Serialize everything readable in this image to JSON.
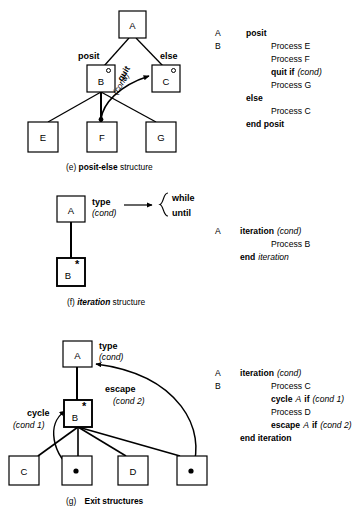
{
  "figure": {
    "panels": [
      {
        "id": "e",
        "caption_prefix": "(e)",
        "caption_bold": "posit-else",
        "caption_suffix": "structure",
        "nodes": [
          {
            "name": "A",
            "label": "A",
            "marker": ""
          },
          {
            "name": "B",
            "label": "B",
            "marker": "circle"
          },
          {
            "name": "C",
            "label": "C",
            "marker": "circle"
          },
          {
            "name": "E",
            "label": "E",
            "marker": ""
          },
          {
            "name": "F",
            "label": "F",
            "marker": ""
          },
          {
            "name": "G",
            "label": "G",
            "marker": ""
          }
        ],
        "edge_labels": [
          {
            "name": "posit-label",
            "text": "posit"
          },
          {
            "name": "else-label",
            "text": "else"
          },
          {
            "name": "quit-label",
            "text": "quit"
          },
          {
            "name": "quit-cond-label",
            "text": "(cond)"
          }
        ],
        "code": [
          {
            "col1": "A",
            "col2": "posit",
            "col2_bold": true,
            "col3": "",
            "indent": 0
          },
          {
            "col1": "B",
            "col2": "",
            "col3": "Process E",
            "indent": 1
          },
          {
            "col1": "",
            "col2": "",
            "col3": "Process F",
            "indent": 1
          },
          {
            "col1": "",
            "col2": "",
            "col3": "quit if (cond)",
            "indent": 1
          },
          {
            "col1": "",
            "col2": "",
            "col3": "Process G",
            "indent": 1
          },
          {
            "col1": "",
            "col2": "else",
            "col2_bold": true,
            "col3": "",
            "indent": 0
          },
          {
            "col1": "",
            "col2": "",
            "col3": "Process C",
            "indent": 1
          },
          {
            "col1": "",
            "col2": "end posit",
            "col2_bold": true,
            "col3": "",
            "indent": 0
          }
        ],
        "code_lines": {
          "l1_a": "A",
          "l1_kw": "posit",
          "l2_b": "B",
          "l2_body": "Process E",
          "l3_body": "Process F",
          "l4_kw": "quit if",
          "l4_cond": "(cond)",
          "l5_body": "Process G",
          "l6_kw": "else",
          "l7_body": "Process C",
          "l8_kw": "end posit"
        }
      },
      {
        "id": "f",
        "caption_prefix": "(f)",
        "caption_bold": "iteration",
        "caption_suffix": "structure",
        "nodes": [
          {
            "name": "A",
            "label": "A",
            "marker": ""
          },
          {
            "name": "B",
            "label": "B",
            "marker": "star"
          }
        ],
        "edge_labels": [
          {
            "name": "type-label",
            "text": "type"
          },
          {
            "name": "type-cond-label",
            "text": "(cond)"
          }
        ],
        "brace_options": [
          "while",
          "until"
        ],
        "code_lines": {
          "l1_a": "A",
          "l1_kw": "iteration",
          "l1_cond": "(cond)",
          "l2_body": "Process B",
          "l3_kw": "end",
          "l3_kw_i": "iteration"
        }
      },
      {
        "id": "g",
        "caption_prefix": "(g)",
        "caption_bold": "Exit structures",
        "caption_suffix": "",
        "nodes": [
          {
            "name": "A",
            "label": "A",
            "marker": ""
          },
          {
            "name": "B",
            "label": "B",
            "marker": "star"
          },
          {
            "name": "C",
            "label": "C",
            "marker": ""
          },
          {
            "name": "exit1",
            "label": "",
            "marker": "dot"
          },
          {
            "name": "D",
            "label": "D",
            "marker": ""
          },
          {
            "name": "exit2",
            "label": "",
            "marker": "dot"
          }
        ],
        "edge_labels": [
          {
            "name": "type-label",
            "text": "type"
          },
          {
            "name": "type-cond-label",
            "text": "(cond)"
          },
          {
            "name": "escape-label",
            "text": "escape"
          },
          {
            "name": "escape-cond-label",
            "text": "(cond 2)"
          },
          {
            "name": "cycle-label",
            "text": "cycle"
          },
          {
            "name": "cycle-cond-label",
            "text": "(cond 1)"
          }
        ],
        "code_lines": {
          "l1_a": "A",
          "l1_kw": "iteration",
          "l1_cond": "(cond)",
          "l2_b": "B",
          "l2_body": "Process C",
          "l3_kw": "cycle",
          "l3_var": "A",
          "l3_if": "if",
          "l3_cond": "(cond 1)",
          "l4_body": "Process D",
          "l5_kw": "escape",
          "l5_var": "A",
          "l5_if": "if",
          "l5_cond": "(cond 2)",
          "l6_kw": "end iteration"
        }
      }
    ]
  },
  "colors": {
    "stroke": "#000000",
    "background": "#ffffff"
  }
}
